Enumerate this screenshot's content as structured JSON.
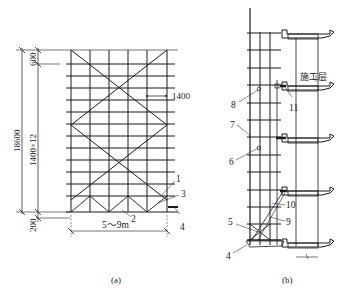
{
  "figure_a": {
    "caption": "(a)",
    "dimensions": {
      "total_height": "18600",
      "top_spacing": "600",
      "step_spacing": "1400×12",
      "bottom_spacing": "200",
      "horizontal_spacing": "1400",
      "width": "5～9m"
    },
    "callouts": [
      "1",
      "2",
      "3",
      "4"
    ]
  },
  "figure_b": {
    "caption": "(b)",
    "construction_floor_label": "施工层",
    "callouts": [
      "4",
      "5",
      "6",
      "7",
      "8",
      "9",
      "10",
      "11"
    ]
  }
}
